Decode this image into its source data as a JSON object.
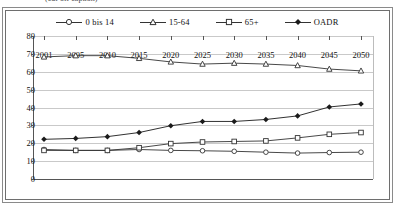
{
  "caption": {
    "text": "(cut-off caption)"
  },
  "chart_data": {
    "type": "line",
    "title": "",
    "xlabel": "",
    "ylabel": "",
    "ylim": [
      0,
      80
    ],
    "ytick_step": 10,
    "yticks": [
      "80",
      "70",
      "60",
      "50",
      "40",
      "30",
      "20",
      "10",
      "0"
    ],
    "grid": true,
    "legend_position": "top-center",
    "categories": [
      "2001",
      "2005",
      "2010",
      "2015",
      "2020",
      "2025",
      "2030",
      "2035",
      "2040",
      "2045",
      "2050"
    ],
    "series": [
      {
        "name": "0 bis 14",
        "marker": "circle-open",
        "color": "#333333",
        "values": [
          16.5,
          16.0,
          16.0,
          16.5,
          16.0,
          15.8,
          15.5,
          15.0,
          14.5,
          14.8,
          15.0
        ]
      },
      {
        "name": "15-64",
        "marker": "triangle-open",
        "color": "#333333",
        "values": [
          68.3,
          69.0,
          69.0,
          67.5,
          65.5,
          64.3,
          64.8,
          64.3,
          63.5,
          61.5,
          60.5
        ]
      },
      {
        "name": "65+",
        "marker": "square-open",
        "color": "#333333",
        "values": [
          16.0,
          16.0,
          16.0,
          17.5,
          19.8,
          20.7,
          21.0,
          21.3,
          23.0,
          25.0,
          26.0
        ]
      },
      {
        "name": "OADR",
        "marker": "diamond-filled",
        "color": "#1a1a1a",
        "values": [
          22.2,
          22.7,
          23.7,
          26.0,
          29.8,
          32.2,
          32.2,
          33.3,
          35.3,
          40.3,
          42.0
        ]
      }
    ]
  },
  "legend": {
    "items": [
      {
        "label": "0 bis 14"
      },
      {
        "label": "15-64"
      },
      {
        "label": "65+"
      },
      {
        "label": "OADR"
      }
    ]
  }
}
